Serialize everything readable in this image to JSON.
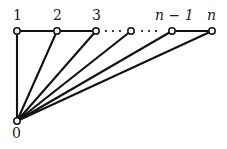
{
  "figure": {
    "background_color": "#ffffff",
    "stroke_color": "#111111",
    "vertex_fill_color": "#ffffff",
    "width": 227,
    "height": 149
  },
  "vertices": [
    {
      "id": "v0",
      "label": "0",
      "label_style": "numeric",
      "x": 17,
      "y": 121,
      "label_x": 12,
      "label_y": 126,
      "labeled": true
    },
    {
      "id": "v1",
      "label": "1",
      "label_style": "numeric",
      "x": 17,
      "y": 31,
      "label_x": 13,
      "label_y": 8,
      "labeled": true
    },
    {
      "id": "v2",
      "label": "2",
      "label_style": "numeric",
      "x": 57,
      "y": 31,
      "label_x": 53,
      "label_y": 8,
      "labeled": true
    },
    {
      "id": "v3",
      "label": "3",
      "label_style": "numeric",
      "x": 96,
      "y": 31,
      "label_x": 92,
      "label_y": 8,
      "labeled": true
    },
    {
      "id": "vmid",
      "label": "",
      "label_style": "numeric",
      "x": 131,
      "y": 31,
      "label_x": 131,
      "label_y": 8,
      "labeled": false
    },
    {
      "id": "vn1",
      "label": "n − 1",
      "label_style": "italic",
      "x": 172,
      "y": 31,
      "label_x": 155,
      "label_y": 8,
      "labeled": true
    },
    {
      "id": "vn",
      "label": "n",
      "label_style": "italic",
      "x": 212,
      "y": 31,
      "label_x": 207,
      "label_y": 8,
      "labeled": true
    }
  ],
  "edges": [
    {
      "id": "e-0-1",
      "from": "v0",
      "to": "v1",
      "kind": "spoke"
    },
    {
      "id": "e-0-2",
      "from": "v0",
      "to": "v2",
      "kind": "spoke"
    },
    {
      "id": "e-0-3",
      "from": "v0",
      "to": "v3",
      "kind": "spoke"
    },
    {
      "id": "e-0-mid",
      "from": "v0",
      "to": "vmid",
      "kind": "spoke"
    },
    {
      "id": "e-0-n1",
      "from": "v0",
      "to": "vn1",
      "kind": "spoke"
    },
    {
      "id": "e-0-n",
      "from": "v0",
      "to": "vn",
      "kind": "spoke"
    },
    {
      "id": "e-1-2",
      "from": "v1",
      "to": "v2",
      "kind": "path"
    },
    {
      "id": "e-2-3",
      "from": "v2",
      "to": "v3",
      "kind": "path"
    },
    {
      "id": "e-n1-n",
      "from": "vn1",
      "to": "vn",
      "kind": "path"
    }
  ],
  "ellipses": [
    {
      "id": "dots-left",
      "between": [
        "v3",
        "vmid"
      ],
      "dots": [
        {
          "x": 106,
          "y": 31
        },
        {
          "x": 113,
          "y": 31
        },
        {
          "x": 120,
          "y": 31
        }
      ]
    },
    {
      "id": "dots-right",
      "between": [
        "vmid",
        "vn1"
      ],
      "dots": [
        {
          "x": 142,
          "y": 31
        },
        {
          "x": 149,
          "y": 31
        },
        {
          "x": 156,
          "y": 31
        }
      ]
    }
  ],
  "geometry": {
    "vertex_radius": 3.2,
    "dot_radius": 1.1,
    "edge_width": 2.1,
    "vertex_stroke_width": 1.5
  }
}
